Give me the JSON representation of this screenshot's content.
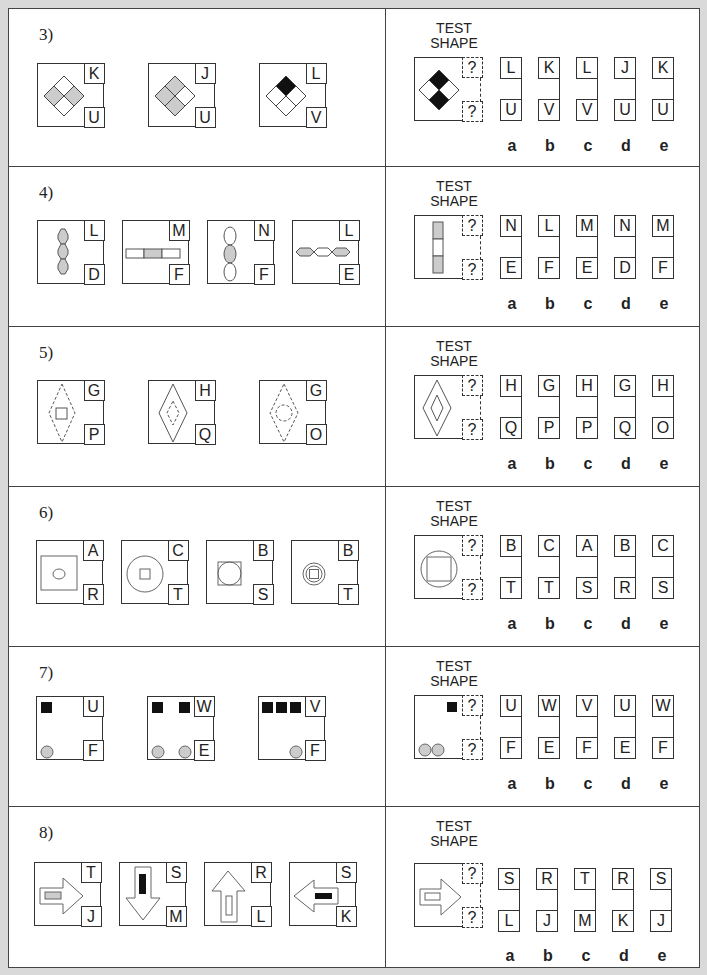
{
  "test_title": "TEST\nSHAPE",
  "unknown_mark": "?",
  "option_letters": [
    "a",
    "b",
    "c",
    "d",
    "e"
  ],
  "questions": [
    {
      "number": "3)",
      "examples": [
        {
          "shape": "diamond-4-gray-left-right",
          "top": "K",
          "bottom": "U"
        },
        {
          "shape": "diamond-4-gray-top-left-bottom",
          "top": "J",
          "bottom": "U"
        },
        {
          "shape": "diamond-4-black-top",
          "top": "L",
          "bottom": "V"
        }
      ],
      "test_shape": "diamond-4-black-top-bottom",
      "options": [
        {
          "top": "L",
          "bottom": "U"
        },
        {
          "top": "K",
          "bottom": "V"
        },
        {
          "top": "L",
          "bottom": "V"
        },
        {
          "top": "J",
          "bottom": "U"
        },
        {
          "top": "K",
          "bottom": "U"
        }
      ]
    },
    {
      "number": "4)",
      "examples": [
        {
          "shape": "vertical-3-hexagons-gray",
          "top": "L",
          "bottom": "D"
        },
        {
          "shape": "horizontal-3-rects-middle-gray",
          "top": "M",
          "bottom": "F"
        },
        {
          "shape": "vertical-3-ellipses-middle-gray",
          "top": "N",
          "bottom": "F"
        },
        {
          "shape": "horizontal-3-hexagons-outer-gray",
          "top": "L",
          "bottom": "E"
        }
      ],
      "test_shape": "vertical-3-rects-outer-gray",
      "options": [
        {
          "top": "N",
          "bottom": "E"
        },
        {
          "top": "L",
          "bottom": "F"
        },
        {
          "top": "M",
          "bottom": "E"
        },
        {
          "top": "N",
          "bottom": "D"
        },
        {
          "top": "M",
          "bottom": "F"
        }
      ]
    },
    {
      "number": "5)",
      "examples": [
        {
          "shape": "dashed-diamond-solid-square",
          "top": "G",
          "bottom": "P"
        },
        {
          "shape": "solid-diamond-dashed-diamond",
          "top": "H",
          "bottom": "Q"
        },
        {
          "shape": "dashed-diamond-dashed-circle",
          "top": "G",
          "bottom": "O"
        }
      ],
      "test_shape": "solid-diamond-solid-diamond",
      "options": [
        {
          "top": "H",
          "bottom": "Q"
        },
        {
          "top": "G",
          "bottom": "P"
        },
        {
          "top": "H",
          "bottom": "P"
        },
        {
          "top": "G",
          "bottom": "Q"
        },
        {
          "top": "H",
          "bottom": "O"
        }
      ]
    },
    {
      "number": "6)",
      "examples": [
        {
          "shape": "large-square-small-circle",
          "top": "A",
          "bottom": "R"
        },
        {
          "shape": "large-circle-small-square",
          "top": "C",
          "bottom": "T"
        },
        {
          "shape": "square-inscribed-circle",
          "top": "B",
          "bottom": "S"
        },
        {
          "shape": "small-circle-small-square",
          "top": "B",
          "bottom": "T"
        }
      ],
      "test_shape": "circle-inscribed-square",
      "options": [
        {
          "top": "B",
          "bottom": "T"
        },
        {
          "top": "C",
          "bottom": "T"
        },
        {
          "top": "A",
          "bottom": "S"
        },
        {
          "top": "B",
          "bottom": "R"
        },
        {
          "top": "C",
          "bottom": "S"
        }
      ]
    },
    {
      "number": "7)",
      "examples": [
        {
          "shape": "1-square-1-circle",
          "top": "U",
          "bottom": "F"
        },
        {
          "shape": "2-squares-2-circles",
          "top": "W",
          "bottom": "E"
        },
        {
          "shape": "3-squares-1-circle",
          "top": "V",
          "bottom": "F"
        }
      ],
      "test_shape": "1-square-2-circles",
      "options": [
        {
          "top": "U",
          "bottom": "F"
        },
        {
          "top": "W",
          "bottom": "E"
        },
        {
          "top": "V",
          "bottom": "F"
        },
        {
          "top": "U",
          "bottom": "E"
        },
        {
          "top": "W",
          "bottom": "F"
        }
      ]
    },
    {
      "number": "8)",
      "examples": [
        {
          "shape": "arrow-right-gray-bar",
          "top": "T",
          "bottom": "J"
        },
        {
          "shape": "arrow-down-black-bar",
          "top": "S",
          "bottom": "M"
        },
        {
          "shape": "arrow-up-white-bar",
          "top": "R",
          "bottom": "L"
        },
        {
          "shape": "arrow-left-black-bar",
          "top": "S",
          "bottom": "K"
        }
      ],
      "test_shape": "arrow-right-white-bar",
      "options": [
        {
          "top": "S",
          "bottom": "L"
        },
        {
          "top": "R",
          "bottom": "J"
        },
        {
          "top": "T",
          "bottom": "M"
        },
        {
          "top": "R",
          "bottom": "K"
        },
        {
          "top": "S",
          "bottom": "J"
        }
      ]
    }
  ]
}
